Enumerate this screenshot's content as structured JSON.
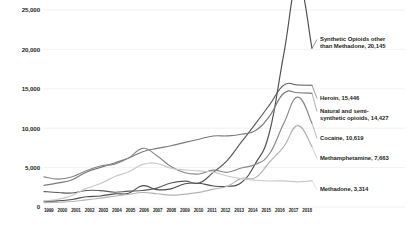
{
  "chart_data": {
    "type": "line",
    "title": "",
    "subtitle": "",
    "xlabel": "",
    "ylabel": "",
    "grid": true,
    "legend_position": "right-inline-endpoint-labels",
    "xlim": [
      1999,
      2018
    ],
    "ylim": [
      0,
      25000
    ],
    "y_ticks": [
      0,
      5000,
      10000,
      15000,
      20000,
      25000
    ],
    "y_tick_labels": [
      "0",
      "5,000",
      "10,000",
      "15,000",
      "20,000",
      "25,000"
    ],
    "categories": [
      "1999",
      "2000",
      "2001",
      "2002",
      "2003",
      "2004",
      "2005",
      "2006",
      "2007",
      "2008",
      "2009",
      "2010",
      "2011",
      "2012",
      "2013",
      "2014",
      "2015",
      "2016",
      "2017",
      "2018"
    ],
    "series": [
      {
        "name": "Synthetic Opioids other than Methadone",
        "color": "#4d4d4d",
        "end_value": 20145,
        "values": [
          730,
          782,
          957,
          1295,
          1400,
          1664,
          1742,
          2707,
          2213,
          2306,
          2946,
          3007,
          2666,
          2628,
          3105,
          5544,
          9580,
          19413,
          28466,
          20145
        ]
      },
      {
        "name": "Heroin",
        "color": "#595959",
        "end_value": 15446,
        "values": [
          1960,
          1842,
          1779,
          2089,
          2080,
          1878,
          2009,
          2088,
          2399,
          3041,
          3278,
          3036,
          4397,
          5925,
          8257,
          10574,
          12989,
          15469,
          15482,
          15446
        ]
      },
      {
        "name": "Natural and semi-synthetic opioids",
        "color": "#7a7a7a",
        "end_value": 14427,
        "values": [
          2749,
          3054,
          3464,
          4416,
          5032,
          5592,
          6213,
          7011,
          7436,
          7767,
          8199,
          8605,
          9007,
          9025,
          9233,
          9707,
          11564,
          14427,
          14495,
          14427
        ]
      },
      {
        "name": "Cocaine",
        "color": "#878787",
        "end_value": 10619,
        "values": [
          3822,
          3544,
          3833,
          4599,
          5198,
          5443,
          6208,
          7448,
          6512,
          5129,
          4350,
          4183,
          4681,
          4404,
          4944,
          5415,
          6784,
          10619,
          13942,
          10619
        ]
      },
      {
        "name": "Methamphetamine",
        "color": "#b3b3b3",
        "end_value": 7663,
        "values": [
          547,
          607,
          700,
          904,
          1128,
          1371,
          1608,
          1841,
          1688,
          1511,
          1632,
          1854,
          2266,
          2635,
          3627,
          3728,
          5716,
          7663,
          10333,
          7663
        ]
      },
      {
        "name": "Methadone",
        "color": "#c9c9c9",
        "end_value": 3314,
        "values": [
          784,
          988,
          1456,
          2360,
          2972,
          3849,
          4462,
          5406,
          5518,
          4924,
          4694,
          4577,
          4418,
          3932,
          3591,
          3400,
          3301,
          3314,
          3194,
          3314
        ]
      }
    ],
    "endpoint_labels": [
      {
        "text": "Synthetic Opioids other\nthan Methadone, 20,145",
        "series": "Synthetic Opioids other than Methadone"
      },
      {
        "text": "Heroin, 15,446",
        "series": "Heroin"
      },
      {
        "text": "Natural and semi-\nsynthetic opioids, 14,427",
        "series": "Natural and semi-synthetic opioids"
      },
      {
        "text": "Cocaine, 10,619",
        "series": "Cocaine"
      },
      {
        "text": "Methamphetamine, 7,663",
        "series": "Methamphetamine"
      },
      {
        "text": "Methadone, 3,314",
        "series": "Methadone"
      }
    ]
  }
}
